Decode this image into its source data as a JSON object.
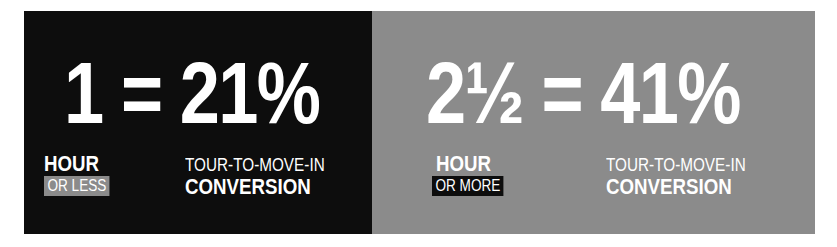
{
  "left": {
    "number": "1 = 21%",
    "unit": "HOUR",
    "qualifier": "OR LESS",
    "metric_top": "TOUR-TO-MOVE-IN",
    "metric_bottom": "CONVERSION",
    "bg": "#0d0d0d",
    "tag_bg": "#8b8b8b"
  },
  "right": {
    "number": "2½ = 41%",
    "unit": "HOUR",
    "qualifier": "OR MORE",
    "metric_top": "TOUR-TO-MOVE-IN",
    "metric_bottom": "CONVERSION",
    "bg": "#8b8b8b",
    "tag_bg": "#0d0d0d"
  }
}
